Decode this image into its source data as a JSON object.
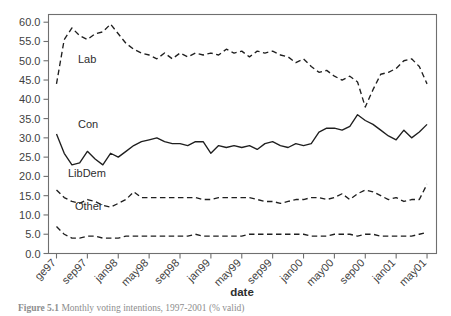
{
  "figure": {
    "caption_prefix": "Figure 5.1",
    "caption_text": "Monthly voting intentions, 1997-2001 (% valid)"
  },
  "axes": {
    "x_title": "date",
    "y_tick_labels": [
      "0.0",
      "5.0",
      "10.0",
      "15.0",
      "20.0",
      "25.0",
      "30.0",
      "35.0",
      "40.0",
      "45.0",
      "50.0",
      "55.0",
      "60.0"
    ],
    "x_tick_labels": [
      "ge97",
      "sep97",
      "jan98",
      "may98",
      "sep98",
      "jan99",
      "may99",
      "sep99",
      "jan00",
      "may00",
      "sep00",
      "jan01",
      "may01"
    ]
  },
  "series_labels": {
    "lab": "Lab",
    "con": "Con",
    "libdem": "LibDem",
    "other": "Other"
  },
  "chart_data": {
    "type": "line",
    "title": "",
    "xlabel": "date",
    "ylabel": "",
    "ylim": [
      0,
      62
    ],
    "yticks": [
      0,
      5,
      10,
      15,
      20,
      25,
      30,
      35,
      40,
      45,
      50,
      55,
      60
    ],
    "grid": false,
    "legend": "inline-labels",
    "x": [
      "ge97",
      "jun97",
      "jul97",
      "aug97",
      "sep97",
      "oct97",
      "nov97",
      "dec97",
      "jan98",
      "feb98",
      "mar98",
      "apr98",
      "may98",
      "jun98",
      "jul98",
      "aug98",
      "sep98",
      "oct98",
      "nov98",
      "dec98",
      "jan99",
      "feb99",
      "mar99",
      "apr99",
      "may99",
      "jun99",
      "jul99",
      "aug99",
      "sep99",
      "oct99",
      "nov99",
      "dec99",
      "jan00",
      "feb00",
      "mar00",
      "apr00",
      "may00",
      "jun00",
      "jul00",
      "aug00",
      "sep00",
      "oct00",
      "nov00",
      "dec00",
      "jan01",
      "feb01",
      "mar01",
      "apr01",
      "may01"
    ],
    "x_tick_indices": [
      0,
      4,
      8,
      12,
      16,
      20,
      24,
      28,
      32,
      36,
      40,
      44,
      48
    ],
    "series": [
      {
        "name": "Lab",
        "style": "dashed",
        "color": "#1f1f1f",
        "values": [
          44.0,
          55.5,
          58.5,
          56.5,
          55.5,
          57.0,
          57.5,
          59.5,
          57.0,
          54.5,
          53.0,
          52.0,
          51.5,
          50.5,
          52.0,
          50.5,
          52.0,
          51.0,
          52.0,
          51.5,
          52.0,
          51.5,
          53.0,
          52.0,
          52.5,
          51.0,
          52.5,
          52.0,
          52.5,
          51.5,
          51.0,
          49.5,
          50.5,
          48.5,
          47.0,
          47.5,
          46.0,
          45.0,
          46.0,
          44.5,
          38.0,
          42.5,
          46.5,
          47.0,
          48.0,
          50.0,
          50.5,
          48.5,
          44.0
        ]
      },
      {
        "name": "Con",
        "style": "solid",
        "color": "#1f1f1f",
        "values": [
          31.0,
          26.0,
          23.0,
          23.5,
          26.5,
          24.5,
          23.0,
          26.0,
          25.0,
          26.5,
          28.0,
          29.0,
          29.5,
          30.0,
          29.0,
          28.5,
          28.5,
          28.0,
          29.0,
          29.0,
          26.0,
          28.0,
          27.5,
          28.0,
          27.5,
          28.0,
          27.0,
          28.5,
          29.0,
          28.0,
          27.5,
          28.5,
          28.0,
          28.5,
          31.5,
          32.5,
          32.5,
          32.0,
          33.0,
          36.0,
          34.5,
          33.5,
          32.0,
          30.5,
          29.5,
          32.0,
          30.0,
          31.5,
          33.5
        ]
      },
      {
        "name": "LibDem",
        "style": "dashed",
        "color": "#1f1f1f",
        "values": [
          16.5,
          14.5,
          13.5,
          13.0,
          14.0,
          13.5,
          12.5,
          12.0,
          13.0,
          14.0,
          16.0,
          14.5,
          14.5,
          14.5,
          14.5,
          14.5,
          14.5,
          14.5,
          14.5,
          14.0,
          14.0,
          14.5,
          14.5,
          14.5,
          14.5,
          14.5,
          14.0,
          13.5,
          13.5,
          13.0,
          13.5,
          14.0,
          14.0,
          14.5,
          14.5,
          14.0,
          14.5,
          15.5,
          14.0,
          15.5,
          16.5,
          16.0,
          15.0,
          14.0,
          14.5,
          13.5,
          14.0,
          14.0,
          18.0
        ]
      },
      {
        "name": "Other",
        "style": "dashed",
        "color": "#1f1f1f",
        "values": [
          7.0,
          5.0,
          4.0,
          4.0,
          4.5,
          4.5,
          4.0,
          4.0,
          4.0,
          4.5,
          4.5,
          4.5,
          4.5,
          4.5,
          4.5,
          4.5,
          4.5,
          4.5,
          5.0,
          4.5,
          4.5,
          4.5,
          4.5,
          4.5,
          4.5,
          5.0,
          5.0,
          5.0,
          5.0,
          5.0,
          5.0,
          5.0,
          5.0,
          4.5,
          4.5,
          4.5,
          5.0,
          5.0,
          5.0,
          4.5,
          5.0,
          5.0,
          4.5,
          4.5,
          4.5,
          4.5,
          4.5,
          5.0,
          5.5
        ]
      }
    ]
  }
}
